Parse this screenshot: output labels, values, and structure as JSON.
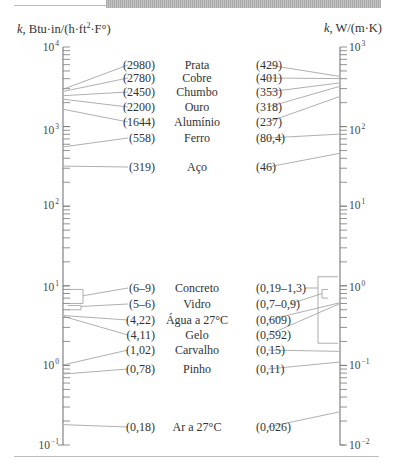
{
  "figure": {
    "left_axis_label": "k, Btu·in/(h·ft²·F°)",
    "right_axis_label": "k, W/(m·K)",
    "left_decades": [
      {
        "base": "10",
        "exp": "4",
        "y": 47
      },
      {
        "base": "10",
        "exp": "3",
        "y": 130
      },
      {
        "base": "10",
        "exp": "2",
        "y": 205
      },
      {
        "base": "10",
        "exp": "1",
        "y": 287
      },
      {
        "base": "10",
        "exp": "0",
        "y": 365
      },
      {
        "base": "10",
        "exp": "−1",
        "y": 445
      }
    ],
    "right_decades": [
      {
        "base": "10",
        "exp": "3",
        "y": 47
      },
      {
        "base": "10",
        "exp": "2",
        "y": 130
      },
      {
        "base": "10",
        "exp": "1",
        "y": 205
      },
      {
        "base": "10",
        "exp": "0",
        "y": 287
      },
      {
        "base": "10",
        "exp": "−1",
        "y": 365
      },
      {
        "base": "10",
        "exp": "−2",
        "y": 445
      }
    ]
  },
  "chart_data": {
    "type": "table",
    "left_axis": {
      "label": "k, Btu·in/(h·ft²·F°)",
      "scale": "log",
      "range": [
        0.1,
        10000
      ]
    },
    "right_axis": {
      "label": "k, W/(m·K)",
      "scale": "log",
      "range": [
        0.01,
        1000
      ]
    },
    "columns": [
      "Material",
      "k (Btu·in/(h·ft²·F°))",
      "k (W/(m·K))"
    ],
    "rows": [
      {
        "name": "Prata",
        "left": "(2980)",
        "right": "(429)"
      },
      {
        "name": "Cobre",
        "left": "(2780)",
        "right": "(401)"
      },
      {
        "name": "Chumbo",
        "left": "(2450)",
        "right": "(353)"
      },
      {
        "name": "Ouro",
        "left": "(2200)",
        "right": "(318)"
      },
      {
        "name": "Alumínio",
        "left": "(1644)",
        "right": "(237)"
      },
      {
        "name": "Ferro",
        "left": "(558)",
        "right": "(80,4)"
      },
      {
        "name": "Aço",
        "left": "(319)",
        "right": "(46)"
      },
      {
        "name": "Concreto",
        "left": "(6–9)",
        "right": "(0,19–1,3)"
      },
      {
        "name": "Vidro",
        "left": "(5–6)",
        "right": "(0,7–0,9)"
      },
      {
        "name": "Água a 27°C",
        "left": "(4,22)",
        "right": "(0,609)"
      },
      {
        "name": "Gelo",
        "left": "(4,11)",
        "right": "(0,592)"
      },
      {
        "name": "Carvalho",
        "left": "(1,02)",
        "right": "(0,15)"
      },
      {
        "name": "Pinho",
        "left": "(0,78)",
        "right": "(0,11)"
      },
      {
        "name": "Ar a 27°C",
        "left": "(0,18)",
        "right": "(0,026)"
      }
    ]
  },
  "rows": [
    {
      "name": "Prata",
      "left": "(2980)",
      "right": "(429)",
      "y": 59
    },
    {
      "name": "Cobre",
      "left": "(2780)",
      "right": "(401)",
      "y": 72
    },
    {
      "name": "Chumbo",
      "left": "(2450)",
      "right": "(353)",
      "y": 86
    },
    {
      "name": "Ouro",
      "left": "(2200)",
      "right": "(318)",
      "y": 101
    },
    {
      "name": "Alumínio",
      "left": "(1644)",
      "right": "(237)",
      "y": 116
    },
    {
      "name": "Ferro",
      "left": "(558)",
      "right": "(80,4)",
      "y": 132
    },
    {
      "name": "Aço",
      "left": "(319)",
      "right": "(46)",
      "y": 161
    },
    {
      "name": "Concreto",
      "left": "(6–9)",
      "right": "(0,19–1,3)",
      "y": 282
    },
    {
      "name": "Vidro",
      "left": "(5–6)",
      "right": "(0,7–0,9)",
      "y": 298
    },
    {
      "name": "Água a 27°C",
      "left": "(4,22)",
      "right": "(0,609)",
      "y": 314
    },
    {
      "name": "Gelo",
      "left": "(4,11)",
      "right": "(0,592)",
      "y": 329
    },
    {
      "name": "Carvalho",
      "left": "(1,02)",
      "right": "(0,15)",
      "y": 344
    },
    {
      "name": "Pinho",
      "left": "(0,78)",
      "right": "(0,11)",
      "y": 363
    },
    {
      "name": "Ar a 27°C",
      "left": "(0,18)",
      "right": "(0,026)",
      "y": 421
    }
  ]
}
